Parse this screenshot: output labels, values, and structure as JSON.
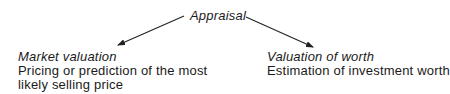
{
  "root": {
    "label": "Appraisal"
  },
  "branches": [
    {
      "title": "Market valuation",
      "lines": [
        "Pricing or prediction of the most",
        "likely selling price"
      ]
    },
    {
      "title": "Valuation of worth",
      "lines": [
        "Estimation of investment worth"
      ]
    }
  ],
  "colors": {
    "text": "#1a1a1a",
    "arrow": "#222222",
    "background": "#ffffff"
  }
}
